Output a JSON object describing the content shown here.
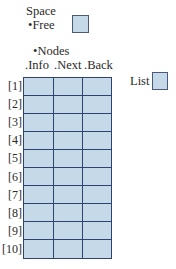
{
  "space": {
    "label": "Space",
    "free_label": "•Free"
  },
  "nodes": {
    "label": "•Nodes",
    "columns": [
      ".Info",
      ".Next",
      ".Back"
    ],
    "rows": [
      "[1]",
      "[2]",
      "[3]",
      "[4]",
      "[5]",
      "[6]",
      "[7]",
      "[8]",
      "[9]",
      "[10]"
    ]
  },
  "list": {
    "label": "List"
  },
  "colors": {
    "cell_fill": "#c5d9e8",
    "grid_line": "#2e4470"
  }
}
